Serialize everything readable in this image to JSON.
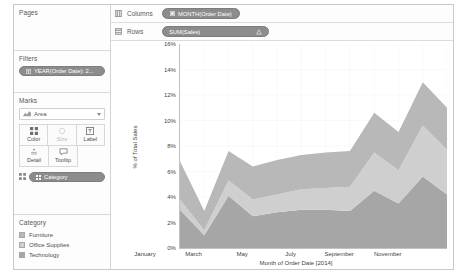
{
  "left_panel": {
    "pages": {
      "title": "Pages"
    },
    "filters": {
      "title": "Filters",
      "pills": [
        {
          "label": "YEAR(Order Date): 2...",
          "icon": "filter-pill-icon"
        }
      ]
    },
    "marks": {
      "title": "Marks",
      "mark_type": "Area",
      "mark_type_icon": "area-mark-icon",
      "buttons": [
        {
          "name": "color",
          "label": "Color",
          "icon": "color-icon",
          "enabled": true
        },
        {
          "name": "size",
          "label": "Size",
          "icon": "size-icon",
          "enabled": false
        },
        {
          "name": "label",
          "label": "Label",
          "icon": "label-icon",
          "enabled": true
        },
        {
          "name": "detail",
          "label": "Detail",
          "icon": "detail-icon",
          "enabled": true
        },
        {
          "name": "tooltip",
          "label": "Tooltip",
          "icon": "tooltip-icon",
          "enabled": true
        }
      ],
      "pills": [
        {
          "label": "Category",
          "icon": "color-encoding-icon"
        }
      ]
    },
    "legend": {
      "title": "Category",
      "items": [
        {
          "label": "Furniture",
          "color": "#b8b8b8"
        },
        {
          "label": "Office Supplies",
          "color": "#cfcfcf"
        },
        {
          "label": "Technology",
          "color": "#a6a6a6"
        }
      ]
    }
  },
  "shelves": {
    "columns": {
      "name": "Columns",
      "icon": "columns-shelf-icon",
      "pill": {
        "label": "MONTH(Order Date)",
        "icon": "date-pill-icon"
      }
    },
    "rows": {
      "name": "Rows",
      "icon": "rows-shelf-icon",
      "pill": {
        "label": "SUM(Sales)",
        "icon": "delta-icon"
      }
    }
  },
  "chart_data": {
    "type": "area",
    "stacked": true,
    "title": "",
    "xlabel": "Month of Order Date [2014]",
    "ylabel": "% of Total Sales",
    "ylim": [
      0,
      0.16
    ],
    "yticks": [
      "0%",
      "2%",
      "4%",
      "6%",
      "8%",
      "10%",
      "12%",
      "14%",
      "16%"
    ],
    "ytick_values": [
      0,
      0.02,
      0.04,
      0.06,
      0.08,
      0.1,
      0.12,
      0.14,
      0.16
    ],
    "grid": true,
    "legend_position": "left-panel",
    "x": [
      "January",
      "February",
      "March",
      "April",
      "May",
      "June",
      "July",
      "August",
      "September",
      "October",
      "November",
      "December"
    ],
    "xtick_labels": [
      "January",
      "March",
      "May",
      "July",
      "September",
      "November"
    ],
    "xtick_indices": [
      0,
      2,
      4,
      6,
      8,
      10
    ],
    "series": [
      {
        "name": "Technology",
        "color": "#a6a6a6",
        "values": [
          0.03,
          0.01,
          0.041,
          0.025,
          0.028,
          0.03,
          0.03,
          0.029,
          0.045,
          0.035,
          0.056,
          0.042
        ]
      },
      {
        "name": "Office Supplies",
        "color": "#cfcfcf",
        "values": [
          0.008,
          0.004,
          0.012,
          0.013,
          0.014,
          0.016,
          0.017,
          0.019,
          0.03,
          0.026,
          0.04,
          0.035
        ]
      },
      {
        "name": "Furniture",
        "color": "#b8b8b8",
        "values": [
          0.03,
          0.015,
          0.023,
          0.026,
          0.027,
          0.027,
          0.028,
          0.028,
          0.031,
          0.03,
          0.034,
          0.033
        ]
      }
    ]
  }
}
